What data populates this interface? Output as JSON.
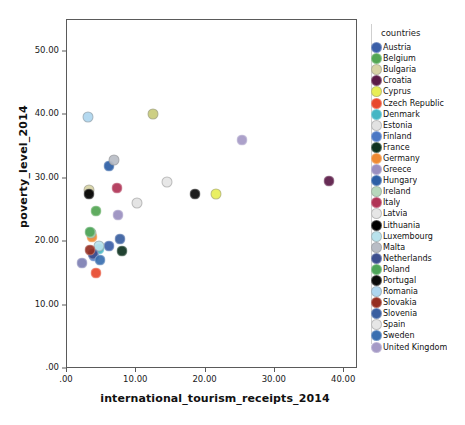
{
  "chart_data": {
    "type": "scatter",
    "title": "",
    "xlabel": "international_tourism_receipts_2014",
    "ylabel": "poverty_level_2014",
    "xlim": [
      0,
      42
    ],
    "ylim": [
      0,
      55
    ],
    "xticks": [
      ".00",
      "10.00",
      "20.00",
      "30.00",
      "40.00"
    ],
    "xtick_values": [
      0,
      10,
      20,
      30,
      40
    ],
    "yticks": [
      ".00",
      "10.00",
      "20.00",
      "30.00",
      "40.00",
      "50.00"
    ],
    "ytick_values": [
      0,
      10,
      20,
      30,
      40,
      50
    ],
    "grid": false,
    "legend_title": "countries",
    "legend_position": "right",
    "points": [
      {
        "name": "Austria",
        "x": 6.2,
        "y": 19.2,
        "color": "#3b5fa8"
      },
      {
        "name": "Belgium",
        "x": 4.3,
        "y": 24.7,
        "color": "#53a653"
      },
      {
        "name": "Bulgaria",
        "x": 3.3,
        "y": 28.0,
        "color": "#d8d4a6"
      },
      {
        "name": "Croatia",
        "x": 37.9,
        "y": 29.4,
        "color": "#5b1b47"
      },
      {
        "name": "Cyprus",
        "x": 21.6,
        "y": 27.5,
        "color": "#e8ee55"
      },
      {
        "name": "Czech Republic",
        "x": 4.3,
        "y": 15.0,
        "color": "#e8492d"
      },
      {
        "name": "Denmark",
        "x": 4.8,
        "y": 18.7,
        "color": "#45b6c4"
      },
      {
        "name": "Estonia",
        "x": 10.2,
        "y": 26.0,
        "color": "#e2e2e2"
      },
      {
        "name": "Finland",
        "x": 4.0,
        "y": 17.6,
        "color": "#4a77c4"
      },
      {
        "name": "France",
        "x": 8.1,
        "y": 18.5,
        "color": "#0f3320"
      },
      {
        "name": "Germany",
        "x": 3.8,
        "y": 20.6,
        "color": "#ef8a33"
      },
      {
        "name": "Greece",
        "x": 7.5,
        "y": 24.1,
        "color": "#9a8fc0"
      },
      {
        "name": "Hungary",
        "x": 6.2,
        "y": 31.9,
        "color": "#2d5fa5"
      },
      {
        "name": "Ireland",
        "x": 3.6,
        "y": 21.3,
        "color": "#b7d8bc"
      },
      {
        "name": "Italy",
        "x": 7.4,
        "y": 28.3,
        "color": "#b03456"
      },
      {
        "name": "Latvia",
        "x": 14.6,
        "y": 29.3,
        "color": "#e6e6e6"
      },
      {
        "name": "Lithuania",
        "x": 3.3,
        "y": 27.5,
        "color": "#000000"
      },
      {
        "name": "Luxembourg",
        "x": 4.8,
        "y": 19.2,
        "color": "#b8e2ec"
      },
      {
        "name": "Malta",
        "x": 6.9,
        "y": 32.8,
        "color": "#b9bdc6"
      },
      {
        "name": "Netherlands",
        "x": 3.9,
        "y": 17.9,
        "color": "#3d4f8f"
      },
      {
        "name": "Poland",
        "x": 3.5,
        "y": 21.5,
        "color": "#4ea559"
      },
      {
        "name": "Portugal",
        "x": 18.6,
        "y": 27.5,
        "color": "#0a0a0a"
      },
      {
        "name": "Romania",
        "x": 3.2,
        "y": 39.5,
        "color": "#aed6ef"
      },
      {
        "name": "Slovakia",
        "x": 3.4,
        "y": 18.6,
        "color": "#952f22"
      },
      {
        "name": "Slovenia",
        "x": 7.8,
        "y": 20.4,
        "color": "#3a5fa0"
      },
      {
        "name": "Spain",
        "x": 12.6,
        "y": 40.1,
        "color": "#c9cc7a"
      },
      {
        "name": "Sweden",
        "x": 4.9,
        "y": 17.0,
        "color": "#3a6fb0"
      },
      {
        "name": "United Kingdom",
        "x": 25.4,
        "y": 35.9,
        "color": "#a59ac6"
      },
      {
        "name": "extra-lilac",
        "x": 2.3,
        "y": 16.6,
        "color": "#7d7fb4"
      }
    ]
  },
  "legend": {
    "title": "countries",
    "items": [
      {
        "label": "Austria",
        "color": "#3b5fa8"
      },
      {
        "label": "Belgium",
        "color": "#53a653"
      },
      {
        "label": "Bulgaria",
        "color": "#d8d4a6"
      },
      {
        "label": "Croatia",
        "color": "#5b1b47"
      },
      {
        "label": "Cyprus",
        "color": "#e8ee55"
      },
      {
        "label": "Czech Republic",
        "color": "#e8492d"
      },
      {
        "label": "Denmark",
        "color": "#45b6c4"
      },
      {
        "label": "Estonia",
        "color": "#e2e2e2"
      },
      {
        "label": "Finland",
        "color": "#4a77c4"
      },
      {
        "label": "France",
        "color": "#0f3320"
      },
      {
        "label": "Germany",
        "color": "#ef8a33"
      },
      {
        "label": "Greece",
        "color": "#9a8fc0"
      },
      {
        "label": "Hungary",
        "color": "#2d5fa5"
      },
      {
        "label": "Ireland",
        "color": "#b7d8bc"
      },
      {
        "label": "Italy",
        "color": "#b03456"
      },
      {
        "label": "Latvia",
        "color": "#e6e6e6"
      },
      {
        "label": "Lithuania",
        "color": "#000000"
      },
      {
        "label": "Luxembourg",
        "color": "#b8e2ec"
      },
      {
        "label": "Malta",
        "color": "#b9bdc6"
      },
      {
        "label": "Netherlands",
        "color": "#3d4f8f"
      },
      {
        "label": "Poland",
        "color": "#4ea559"
      },
      {
        "label": "Portugal",
        "color": "#0a0a0a"
      },
      {
        "label": "Romania",
        "color": "#aed6ef"
      },
      {
        "label": "Slovakia",
        "color": "#952f22"
      },
      {
        "label": "Slovenia",
        "color": "#3a5fa0"
      },
      {
        "label": "Spain",
        "color": "#e6e6e6"
      },
      {
        "label": "Sweden",
        "color": "#3a6fb0"
      },
      {
        "label": "United Kingdom",
        "color": "#a59ac6"
      }
    ]
  }
}
